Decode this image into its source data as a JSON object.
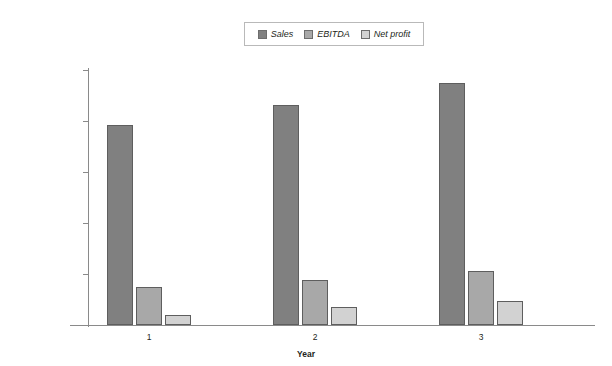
{
  "chart_data": {
    "type": "bar",
    "title": "",
    "xlabel": "Year",
    "ylabel": "",
    "categories": [
      "1",
      "2",
      "3"
    ],
    "series": [
      {
        "name": "Sales",
        "color": "#808080",
        "values": [
          785000,
          863000,
          948000
        ]
      },
      {
        "name": "EBITDA",
        "color": "#a8a8a8",
        "values": [
          150000,
          178000,
          213000
        ]
      },
      {
        "name": "Net profit",
        "color": "#d2d2d2",
        "values": [
          38000,
          70000,
          93000
        ]
      }
    ],
    "ylim": [
      0,
      1000000
    ],
    "ytick_values": [
      0,
      200000,
      400000,
      600000,
      800000,
      1000000
    ],
    "ytick_labels": [
      "$0",
      "$200,000",
      "$400,000",
      "$600,000",
      "$800,000",
      "$1,000,000"
    ],
    "grid": false,
    "legend_position": "top-center"
  },
  "legend": {
    "entries": [
      {
        "label": "Sales"
      },
      {
        "label": "EBITDA"
      },
      {
        "label": "Net profit"
      }
    ]
  },
  "axes": {
    "x_title": "Year",
    "x_labels": [
      "1",
      "2",
      "3"
    ],
    "y_labels": [
      "$1,000,000",
      "$800,000",
      "$600,000",
      "$400,000",
      "$200,000",
      "$0"
    ]
  },
  "colors": {
    "sales": "#808080",
    "ebitda": "#a8a8a8",
    "net_profit": "#d2d2d2",
    "axis": "#8a8a8a",
    "bar_stroke": "#5e5e5e",
    "background": "#ffffff"
  }
}
